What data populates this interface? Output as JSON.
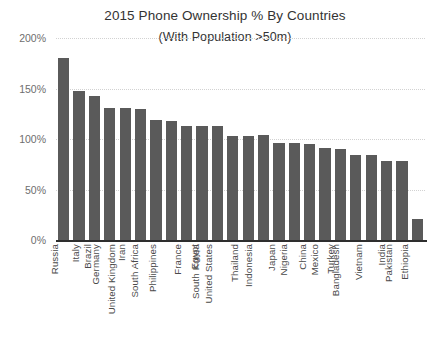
{
  "chart_data": {
    "type": "bar",
    "title": "2015 Phone Ownership % By Countries",
    "subtitle": "(With Population >50m)",
    "xlabel": "",
    "ylabel": "",
    "ylim": [
      0,
      200
    ],
    "yticks": [
      0,
      50,
      100,
      150,
      200
    ],
    "ytick_labels": [
      "0%",
      "50%",
      "100%",
      "150%",
      "200%"
    ],
    "grid": true,
    "legend": false,
    "bar_color": "#5a5a5a",
    "categories": [
      "Russia",
      "Italy",
      "Brazil",
      "Germany",
      "Iran",
      "United Kingdom",
      "South Africa",
      "Philippines",
      "France",
      "Egypt",
      "South Korea",
      "United States",
      "Thailand",
      "Indonesia",
      "Japan",
      "Nigeria",
      "China",
      "Mexico",
      "Turkey",
      "Bangladesh",
      "Vietnam",
      "India",
      "Pakistan",
      "Ethiopia"
    ],
    "values": [
      180,
      148,
      143,
      131,
      131,
      130,
      119,
      118,
      113,
      113,
      113,
      103,
      103,
      104,
      96,
      96,
      95,
      91,
      90,
      84,
      84,
      78,
      78,
      21
    ],
    "value_unit": "%"
  }
}
